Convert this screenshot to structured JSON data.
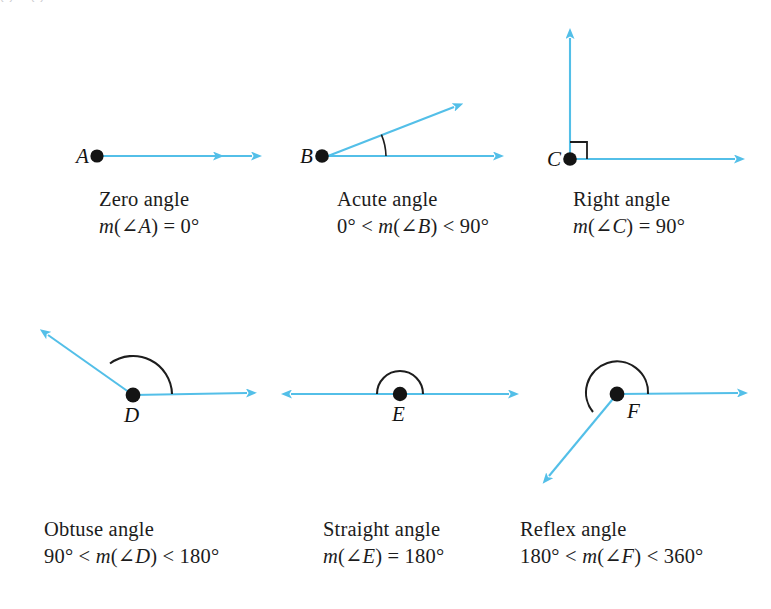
{
  "figure": {
    "background_color": "#ffffff",
    "ray_color": "#53bfe8",
    "arc_color": "#1d1d1d",
    "label_color": "#131313",
    "width": 771,
    "height": 609,
    "top_bleed_text": "◡        ◡"
  },
  "angles": [
    {
      "id": "zero",
      "vertex_label": "A",
      "name": "Zero angle",
      "measure": "m(∠A) = 0°",
      "measure_parts": {
        "m": "m",
        "open": "(∠",
        "point": "A",
        "close": ")",
        "relation": " = 0°"
      },
      "degrees": "0°",
      "marker": "none",
      "rays": 2,
      "description": "two coincident rays pointing right"
    },
    {
      "id": "acute",
      "vertex_label": "B",
      "name": "Acute angle",
      "measure": "0° < m(∠B) < 90°",
      "measure_parts": {
        "lower": "0° < ",
        "m": "m",
        "open": "(∠",
        "point": "B",
        "close": ")",
        "upper": " < 90°"
      },
      "degrees_range": [
        "0°",
        "90°"
      ],
      "marker": "single-arc",
      "rays": 2,
      "description": "horizontal ray and upward-sloping ray"
    },
    {
      "id": "right",
      "vertex_label": "C",
      "name": "Right angle",
      "measure": "m(∠C) = 90°",
      "measure_parts": {
        "m": "m",
        "open": "(∠",
        "point": "C",
        "close": ")",
        "relation": " = 90°"
      },
      "degrees": "90°",
      "marker": "right-angle-square",
      "rays": 2,
      "description": "horizontal ray and vertical ray"
    },
    {
      "id": "obtuse",
      "vertex_label": "D",
      "name": "Obtuse angle",
      "measure": "90° < m(∠D) < 180°",
      "measure_parts": {
        "lower": "90° < ",
        "m": "m",
        "open": "(∠",
        "point": "D",
        "close": ")",
        "upper": " < 180°"
      },
      "degrees_range": [
        "90°",
        "180°"
      ],
      "marker": "wide-arc",
      "rays": 2,
      "description": "horizontal ray right and ray up-left"
    },
    {
      "id": "straight",
      "vertex_label": "E",
      "name": "Straight angle",
      "measure": "m(∠E) = 180°",
      "measure_parts": {
        "m": "m",
        "open": "(∠",
        "point": "E",
        "close": ")",
        "relation": " = 180°"
      },
      "degrees": "180°",
      "marker": "semicircle-arc",
      "rays": 2,
      "description": "opposite rays forming a line"
    },
    {
      "id": "reflex",
      "vertex_label": "F",
      "name": "Reflex angle",
      "measure": "180° < m(∠F) < 360°",
      "measure_parts": {
        "lower": "180° < ",
        "m": "m",
        "open": "(∠",
        "point": "F",
        "close": ")",
        "upper": " < 360°"
      },
      "degrees_range": [
        "180°",
        "360°"
      ],
      "marker": "reflex-arc",
      "rays": 2,
      "description": "horizontal ray right and ray down-left with major arc"
    }
  ]
}
